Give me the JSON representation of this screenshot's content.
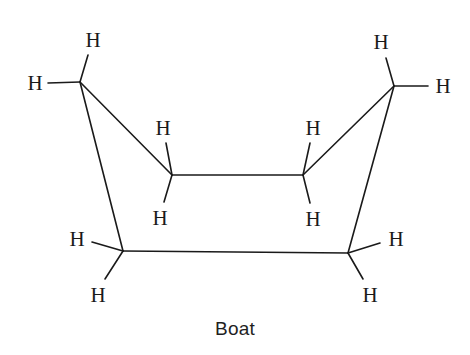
{
  "figure": {
    "caption": "Boat",
    "molecule_name": "cyclohexane boat conformation",
    "stroke_color": "#1a1a1a",
    "stroke_width": 1.6,
    "background_color": "#ffffff",
    "width": 470,
    "height": 355
  },
  "ring": {
    "label": "carbon ring skeleton",
    "vertices": [
      {
        "id": "C1",
        "x": 80,
        "y": 82
      },
      {
        "id": "C2",
        "x": 172,
        "y": 175
      },
      {
        "id": "C3",
        "x": 303,
        "y": 175
      },
      {
        "id": "C4",
        "x": 394,
        "y": 86
      },
      {
        "id": "C5",
        "x": 348,
        "y": 253
      },
      {
        "id": "C6",
        "x": 123,
        "y": 251
      }
    ],
    "bonds": [
      {
        "from": "C1",
        "to": "C2"
      },
      {
        "from": "C2",
        "to": "C3"
      },
      {
        "from": "C3",
        "to": "C4"
      },
      {
        "from": "C4",
        "to": "C5"
      },
      {
        "from": "C5",
        "to": "C6"
      },
      {
        "from": "C6",
        "to": "C1"
      }
    ]
  },
  "hydrogens": [
    {
      "id": "H1",
      "text": "H",
      "label_x": 93,
      "label_y": 40,
      "bond_from": "C1",
      "bond_x": 88,
      "bond_y": 55,
      "position": "top-left-up"
    },
    {
      "id": "H2",
      "text": "H",
      "label_x": 35,
      "label_y": 83,
      "bond_from": "C1",
      "bond_x": 48,
      "bond_y": 83,
      "position": "top-left-side"
    },
    {
      "id": "H3",
      "text": "H",
      "label_x": 163,
      "label_y": 128,
      "bond_from": "C2",
      "bond_x": 166,
      "bond_y": 143,
      "position": "inner-left-up"
    },
    {
      "id": "H4",
      "text": "H",
      "label_x": 160,
      "label_y": 218,
      "bond_from": "C2",
      "bond_x": 164,
      "bond_y": 202,
      "position": "inner-left-down"
    },
    {
      "id": "H5",
      "text": "H",
      "label_x": 313,
      "label_y": 128,
      "bond_from": "C3",
      "bond_x": 310,
      "bond_y": 143,
      "position": "inner-right-up"
    },
    {
      "id": "H6",
      "text": "H",
      "label_x": 313,
      "label_y": 219,
      "bond_from": "C3",
      "bond_x": 310,
      "bond_y": 203,
      "position": "inner-right-down"
    },
    {
      "id": "H7",
      "text": "H",
      "label_x": 381,
      "label_y": 42,
      "bond_from": "C4",
      "bond_x": 386,
      "bond_y": 58,
      "position": "top-right-up"
    },
    {
      "id": "H8",
      "text": "H",
      "label_x": 443,
      "label_y": 86,
      "bond_from": "C4",
      "bond_x": 428,
      "bond_y": 86,
      "position": "top-right-side"
    },
    {
      "id": "H9",
      "text": "H",
      "label_x": 77,
      "label_y": 239,
      "bond_from": "C6",
      "bond_x": 92,
      "bond_y": 242,
      "position": "bottom-left-side"
    },
    {
      "id": "H10",
      "text": "H",
      "label_x": 98,
      "label_y": 295,
      "bond_from": "C6",
      "bond_x": 105,
      "bond_y": 279,
      "position": "bottom-left-down"
    },
    {
      "id": "H11",
      "text": "H",
      "label_x": 396,
      "label_y": 239,
      "bond_from": "C5",
      "bond_x": 380,
      "bond_y": 243,
      "position": "bottom-right-side"
    },
    {
      "id": "H12",
      "text": "H",
      "label_x": 370,
      "label_y": 295,
      "bond_from": "C5",
      "bond_x": 363,
      "bond_y": 279,
      "position": "bottom-right-down"
    }
  ]
}
